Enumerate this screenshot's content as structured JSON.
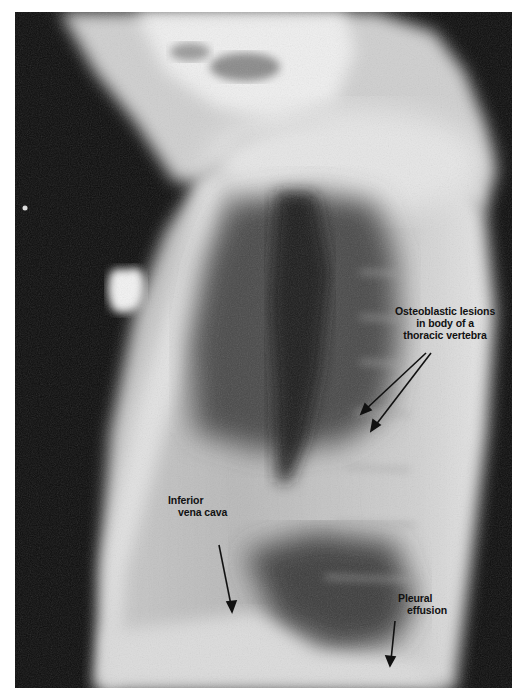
{
  "figure": {
    "annotations": [
      {
        "id": "osteoblastic",
        "lines": [
          "Osteoblastic lesions",
          "in body of a",
          "thoracic vertebra"
        ],
        "arrow_count": 2
      },
      {
        "id": "ivc",
        "lines": [
          "Inferior",
          "vena cava"
        ],
        "arrow_count": 1
      },
      {
        "id": "effusion",
        "lines": [
          "Pleural",
          "effusion"
        ],
        "arrow_count": 1
      }
    ],
    "colors": {
      "background_film": "#0c0c0c",
      "soft_tissue": "#d8d8d8",
      "lung_air": "#3a3a3a",
      "label_text": "#111111",
      "margin": "#ffffff"
    }
  }
}
